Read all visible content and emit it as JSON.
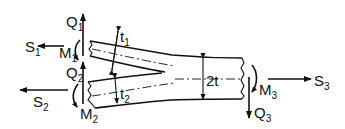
{
  "figure": {
    "labels": {
      "S1": {
        "main": "S",
        "sub": "1"
      },
      "S2": {
        "main": "S",
        "sub": "2"
      },
      "S3": {
        "main": "S",
        "sub": "3"
      },
      "Q1": {
        "main": "Q",
        "sub": "1"
      },
      "Q2": {
        "main": "Q",
        "sub": "2"
      },
      "Q3": {
        "main": "Q",
        "sub": "3"
      },
      "M1": {
        "main": "M",
        "sub": "1"
      },
      "M2": {
        "main": "M",
        "sub": "2"
      },
      "M3": {
        "main": "M",
        "sub": "3"
      },
      "t1": {
        "main": "t",
        "sub": "1"
      },
      "t2": {
        "main": "t",
        "sub": "2"
      },
      "thickness_combined": "2t"
    },
    "colors": {
      "line": "#111111",
      "background": "#ffffff"
    }
  }
}
